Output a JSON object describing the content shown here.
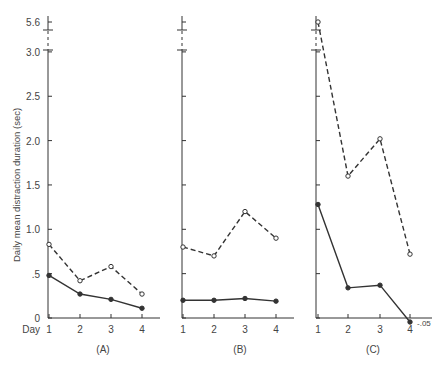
{
  "chart_data": {
    "type": "line",
    "ylabel": "Daily mean distraction duration (sec)",
    "xlabel": "Day",
    "yticks": [
      "0",
      ".5",
      "1.0",
      "1.5",
      "2.0",
      "2.5",
      "3.0",
      "5.6"
    ],
    "ylim": [
      0,
      3.0
    ],
    "axis_break": {
      "from": 3.0,
      "to": 5.6
    },
    "categories": [
      "1",
      "2",
      "3",
      "4"
    ],
    "grid": false,
    "panels": [
      {
        "label": "(A)",
        "series": [
          {
            "name": "open-circle dashed",
            "style": "dashed",
            "marker": "open",
            "values": [
              0.83,
              0.42,
              0.58,
              0.27
            ]
          },
          {
            "name": "filled-circle solid",
            "style": "solid",
            "marker": "filled",
            "values": [
              0.48,
              0.27,
              0.21,
              0.11
            ]
          }
        ]
      },
      {
        "label": "(B)",
        "series": [
          {
            "name": "open-circle dashed",
            "style": "dashed",
            "marker": "open",
            "values": [
              0.8,
              0.7,
              1.2,
              0.9
            ]
          },
          {
            "name": "filled-circle solid",
            "style": "solid",
            "marker": "filled",
            "values": [
              0.2,
              0.2,
              0.22,
              0.19
            ]
          }
        ]
      },
      {
        "label": "(C)",
        "series": [
          {
            "name": "open-circle dashed",
            "style": "dashed",
            "marker": "open",
            "values": [
              5.6,
              1.6,
              2.02,
              0.72
            ]
          },
          {
            "name": "filled-circle solid",
            "style": "solid",
            "marker": "filled",
            "values": [
              1.28,
              0.34,
              0.37,
              -0.05
            ]
          }
        ],
        "annotation": "-.05"
      }
    ]
  }
}
